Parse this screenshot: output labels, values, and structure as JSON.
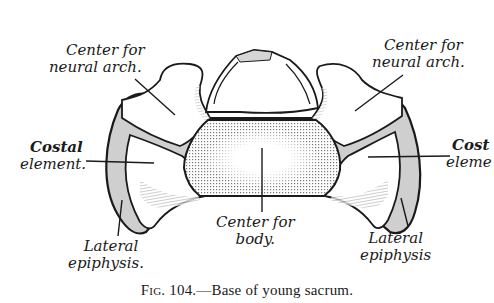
{
  "figure": {
    "title": "Base of young sacrum",
    "caption_prefix": "Fig.",
    "caption_number": "104.",
    "caption_text": "—Base of young sacrum.",
    "labels": {
      "neural_arch_left_line1": "Center for",
      "neural_arch_left_line2": "neural arch.",
      "neural_arch_right_line1": "Center for",
      "neural_arch_right_line2": "neural arch.",
      "costal_left_line1": "Costal",
      "costal_left_line2": "element.",
      "costal_right_line1": "Cost",
      "costal_right_line2": "eleme",
      "body_line1": "Center for",
      "body_line2": "body.",
      "lateral_left_line1": "Lateral",
      "lateral_left_line2": "epiphysis.",
      "lateral_right_line1": "Lateral",
      "lateral_right_line2": "epiphysis"
    },
    "colors": {
      "ink": "#1a1a1a",
      "cartilage_gray": "#c8c8c8",
      "background": "#ffffff"
    }
  }
}
